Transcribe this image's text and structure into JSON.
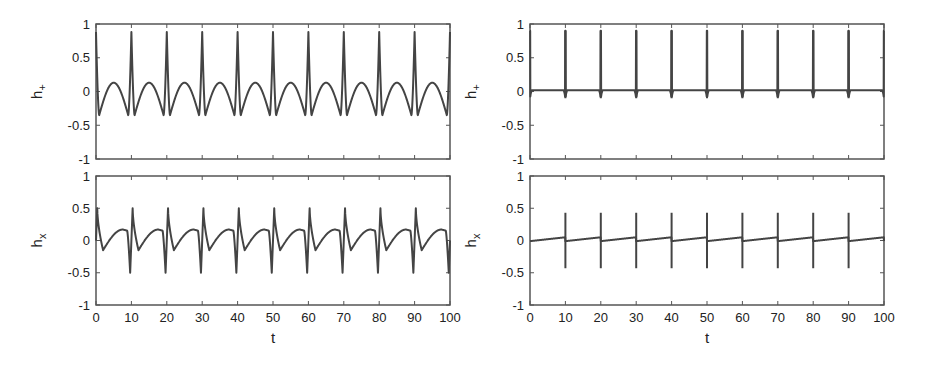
{
  "figure": {
    "background": "#ffffff",
    "line_color": "#444444"
  },
  "chart_data": [
    {
      "id": "top-left",
      "type": "line",
      "title": "",
      "xlabel": "",
      "ylabel": "h+",
      "ylabel_main": "h",
      "ylabel_sub": "+",
      "xlim": [
        0,
        100
      ],
      "ylim": [
        -1,
        1
      ],
      "yticks": [
        "1",
        "0.5",
        "0",
        "-0.5",
        "-1"
      ],
      "xticks": [],
      "grid": false,
      "description": "Periodic signal with period 10: narrow peaks of ~0.88 at t = 10, 20, ..., 90 flanked by minima of ~-0.35, with rounded arches reaching ~0.13 between peaks",
      "series": [
        {
          "name": "h+",
          "period": 10,
          "peak": 0.88,
          "trough": -0.35,
          "arch_max": 0.13
        }
      ]
    },
    {
      "id": "bottom-left",
      "type": "line",
      "title": "",
      "xlabel": "t",
      "ylabel": "hx",
      "ylabel_main": "h",
      "ylabel_sub": "x",
      "xlim": [
        0,
        100
      ],
      "ylim": [
        -1,
        1
      ],
      "yticks": [
        "1",
        "0.5",
        "0",
        "-0.5",
        "-1"
      ],
      "xticks": [
        "0",
        "10",
        "20",
        "30",
        "40",
        "50",
        "60",
        "70",
        "80",
        "90",
        "100"
      ],
      "grid": false,
      "description": "Periodic signal with period 10: sharp dip to ~-0.5 just before each multiple of 10 followed by sharp peak ~0.5, then slow sawtooth rise from ~-0.15 to ~0.17",
      "series": [
        {
          "name": "hx",
          "period": 10,
          "peak": 0.5,
          "trough": -0.5,
          "slow_min": -0.15,
          "slow_max": 0.17
        }
      ]
    },
    {
      "id": "top-right",
      "type": "line",
      "title": "",
      "xlabel": "",
      "ylabel": "h+",
      "ylabel_main": "h",
      "ylabel_sub": "+",
      "xlim": [
        0,
        100
      ],
      "ylim": [
        -1,
        1
      ],
      "yticks": [
        "1",
        "0.5",
        "0",
        "-0.5",
        "-1"
      ],
      "xticks": [],
      "grid": false,
      "description": "Nearly flat baseline ~0.02 with very narrow spikes to ~0.9 at t = 10, 20, ..., 90 and small dips to ~-0.1 at the spike bases",
      "series": [
        {
          "name": "h+",
          "period": 10,
          "peak": 0.9,
          "trough": -0.1,
          "baseline": 0.02
        }
      ]
    },
    {
      "id": "bottom-right",
      "type": "line",
      "title": "",
      "xlabel": "t",
      "ylabel": "hx",
      "ylabel_main": "h",
      "ylabel_sub": "x",
      "xlim": [
        0,
        100
      ],
      "ylim": [
        -1,
        1
      ],
      "yticks": [
        "1",
        "0.5",
        "0",
        "-0.5",
        "-1"
      ],
      "xticks": [
        "0",
        "10",
        "20",
        "30",
        "40",
        "50",
        "60",
        "70",
        "80",
        "90",
        "100"
      ],
      "grid": false,
      "description": "Near-zero baseline slowly rising (0 to ~0.05) within each period, with narrow bipolar spikes to ~+0.43 and ~-0.43 at t = 10, 20, ..., 90",
      "series": [
        {
          "name": "hx",
          "period": 10,
          "peak": 0.43,
          "trough": -0.43,
          "baseline_start": -0.01,
          "baseline_end": 0.05
        }
      ]
    }
  ]
}
